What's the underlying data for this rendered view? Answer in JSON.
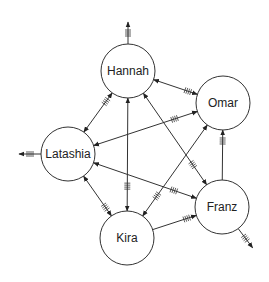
{
  "diagram": {
    "type": "directed-graph",
    "nodes": [
      {
        "id": "hannah",
        "label": "Hannah",
        "x": 128,
        "y": 71
      },
      {
        "id": "omar",
        "label": "Omar",
        "x": 223,
        "y": 103
      },
      {
        "id": "latashia",
        "label": "Latashia",
        "x": 68,
        "y": 154
      },
      {
        "id": "franz",
        "label": "Franz",
        "x": 222,
        "y": 207
      },
      {
        "id": "kira",
        "label": "Kira",
        "x": 127,
        "y": 238
      }
    ],
    "edges": [
      {
        "from": "hannah",
        "to": "omar",
        "bidirectional": true
      },
      {
        "from": "latashia",
        "to": "hannah",
        "bidirectional": true
      },
      {
        "from": "latashia",
        "to": "omar",
        "bidirectional": true
      },
      {
        "from": "hannah",
        "to": "franz",
        "bidirectional": true
      },
      {
        "from": "hannah",
        "to": "kira",
        "bidirectional": true
      },
      {
        "from": "omar",
        "to": "kira",
        "bidirectional": true
      },
      {
        "from": "latashia",
        "to": "kira",
        "bidirectional": true
      },
      {
        "from": "latashia",
        "to": "franz",
        "bidirectional": true
      },
      {
        "from": "kira",
        "to": "franz",
        "bidirectional": false
      },
      {
        "from": "franz",
        "to": "omar",
        "bidirectional": false
      }
    ],
    "external_edges": [
      {
        "from": "hannah",
        "direction": "up"
      },
      {
        "from": "latashia",
        "direction": "left"
      },
      {
        "from": "franz",
        "direction": "down-right"
      }
    ],
    "colors": {
      "stroke": "#333333",
      "fill": "#ffffff",
      "text": "#222222"
    }
  }
}
